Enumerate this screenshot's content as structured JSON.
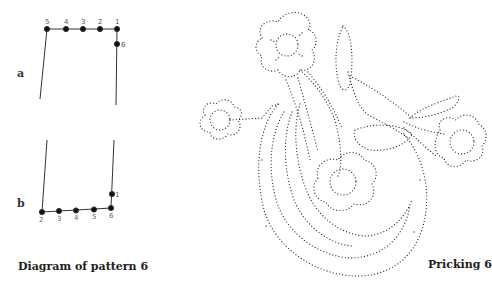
{
  "diagram": {
    "caption": "Diagram of pattern 6",
    "part_a": {
      "label": "a",
      "top_pins": [
        "5",
        "4",
        "3",
        "2",
        "1"
      ],
      "side_pin": "6"
    },
    "part_b": {
      "label": "b",
      "bottom_pins": [
        "2",
        "3",
        "4",
        "5",
        "6"
      ],
      "side_pin": "1"
    }
  },
  "pricking": {
    "caption": "Pricking 6",
    "motif": "dotted flower-and-leaf pricking pattern with four flowers and a large curved stem"
  },
  "colors": {
    "ink": "#1e1e1e",
    "line": "#444444",
    "background": "#ffffff"
  }
}
